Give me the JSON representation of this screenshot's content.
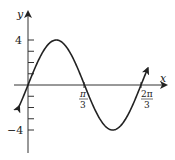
{
  "chart_data": {
    "type": "line",
    "title": "",
    "function": "y = 4 sin(3x)",
    "xlabel": "x",
    "ylabel": "y",
    "x_ticks": [
      {
        "value": 1.0472,
        "label_num": "π",
        "label_den": "3"
      },
      {
        "value": 2.0944,
        "label_num": "2π",
        "label_den": "3"
      }
    ],
    "y_ticks": [
      -4,
      -3,
      -2,
      -1,
      1,
      2,
      3,
      4
    ],
    "y_tick_labels": [
      {
        "value": 4,
        "label": "4"
      },
      {
        "value": -4,
        "label": "-4"
      }
    ],
    "xlim": [
      -0.1,
      2.3
    ],
    "ylim": [
      -5.5,
      5.5
    ],
    "series": [
      {
        "name": "4 sin(3x)",
        "amplitude": 4,
        "period_label": "2π/3",
        "zeros": [
          0,
          1.0472,
          2.0944
        ],
        "max": {
          "x": 0.5236,
          "y": 4
        },
        "min": {
          "x": 1.5708,
          "y": -4
        }
      }
    ],
    "grid": false,
    "legend": "none",
    "line_color": "#222222"
  },
  "labels": {
    "x_axis": "x",
    "y_axis": "y",
    "y_top": "4",
    "y_bottom": "−4",
    "pi3_num": "π",
    "pi3_den": "3",
    "tpi3_num": "2π",
    "tpi3_den": "3"
  }
}
